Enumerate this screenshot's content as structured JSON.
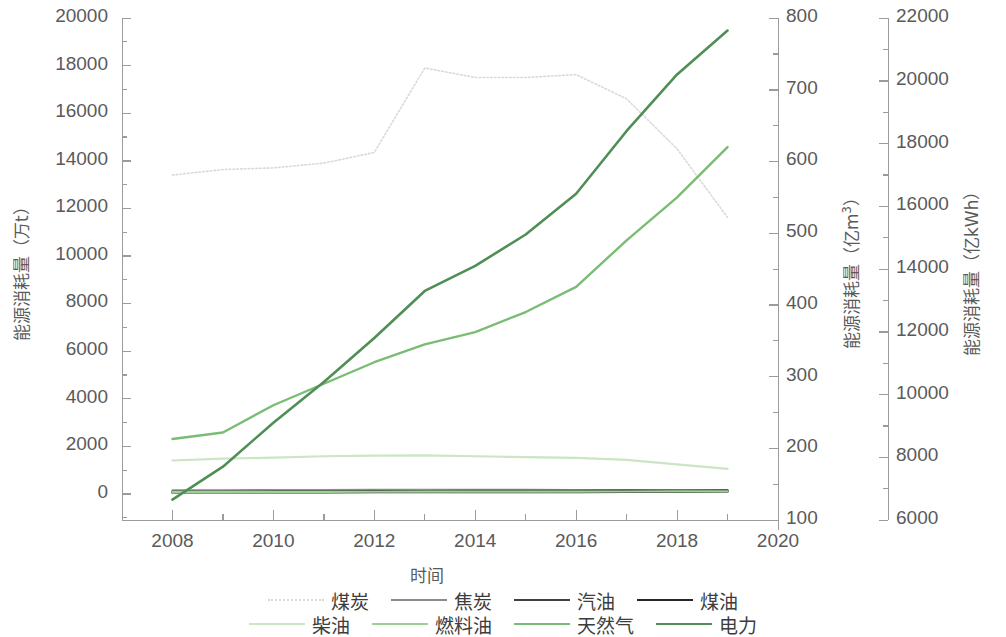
{
  "chart_data": {
    "type": "line",
    "title": "",
    "xlabel": "时间",
    "x": [
      2008,
      2009,
      2010,
      2011,
      2012,
      2013,
      2014,
      2015,
      2016,
      2017,
      2018,
      2019
    ],
    "xlim": [
      2007,
      2020
    ],
    "xticks": [
      2008,
      2010,
      2012,
      2014,
      2016,
      2018,
      2020
    ],
    "xminorticks": [
      2009,
      2011,
      2013,
      2015,
      2017,
      2019
    ],
    "grid": false,
    "legend_position": "bottom",
    "axes": [
      {
        "id": "left",
        "label": "能源消耗量（万t）",
        "unit": "万t",
        "lim": [
          -1100,
          20000
        ],
        "ticks": [
          0,
          2000,
          4000,
          6000,
          8000,
          10000,
          12000,
          14000,
          16000,
          18000,
          20000
        ],
        "minor_step": 1000
      },
      {
        "id": "right1",
        "label": "能源消耗量（亿m³）",
        "unit": "亿m3",
        "lim": [
          100,
          800
        ],
        "ticks": [
          100,
          200,
          300,
          400,
          500,
          600,
          700,
          800
        ],
        "minor_step": 50
      },
      {
        "id": "right2",
        "label": "能源消耗量（亿kWh）",
        "unit": "亿kWh",
        "lim": [
          6000,
          22000
        ],
        "ticks": [
          6000,
          8000,
          10000,
          12000,
          14000,
          16000,
          18000,
          20000,
          22000
        ],
        "minor_step": 1000
      }
    ],
    "series": [
      {
        "name": "煤炭",
        "axis": "left",
        "color": "#d9d9d9",
        "style": "dotted",
        "width": 1.6,
        "values": [
          13400,
          13630,
          13700,
          13900,
          14350,
          17900,
          17500,
          17500,
          17620,
          16600,
          14500,
          11620
        ]
      },
      {
        "name": "焦炭",
        "axis": "left",
        "color": "#8c8c8c",
        "style": "solid",
        "width": 2.0,
        "values": [
          150,
          150,
          160,
          165,
          170,
          175,
          175,
          170,
          165,
          160,
          155,
          150
        ]
      },
      {
        "name": "汽油",
        "axis": "left",
        "color": "#404040",
        "style": "solid",
        "width": 2.2,
        "values": [
          90,
          95,
          100,
          105,
          110,
          115,
          120,
          125,
          130,
          135,
          140,
          145
        ]
      },
      {
        "name": "煤油",
        "axis": "left",
        "color": "#262626",
        "style": "solid",
        "width": 2.4,
        "values": [
          60,
          62,
          65,
          68,
          70,
          73,
          75,
          78,
          80,
          85,
          90,
          95
        ]
      },
      {
        "name": "柴油",
        "axis": "left",
        "color": "#cbe5c5",
        "style": "solid",
        "width": 2.2,
        "values": [
          1400,
          1480,
          1520,
          1580,
          1610,
          1620,
          1580,
          1540,
          1510,
          1430,
          1240,
          1050
        ]
      },
      {
        "name": "燃料油",
        "axis": "left",
        "color": "#9ecf96",
        "style": "solid",
        "width": 2.2,
        "values": [
          80,
          82,
          84,
          86,
          88,
          90,
          92,
          94,
          96,
          98,
          100,
          102
        ]
      },
      {
        "name": "天然气",
        "axis": "right1",
        "color": "#79bd74",
        "style": "solid",
        "width": 2.4,
        "values": [
          213,
          222,
          260,
          290,
          320,
          345,
          362,
          390,
          425,
          490,
          550,
          620
        ]
      },
      {
        "name": "电力",
        "axis": "right2",
        "color": "#4f8f55",
        "style": "solid",
        "width": 2.6,
        "values": [
          6650,
          7700,
          9100,
          10400,
          11800,
          13300,
          14100,
          15100,
          16400,
          18400,
          20200,
          21600
        ]
      }
    ]
  },
  "legend": {
    "rows": [
      [
        {
          "label": "煤炭",
          "color": "#d9d9d9",
          "style": "dotted"
        },
        {
          "label": "焦炭",
          "color": "#8c8c8c",
          "style": "solid"
        },
        {
          "label": "汽油",
          "color": "#404040",
          "style": "solid"
        },
        {
          "label": "煤油",
          "color": "#262626",
          "style": "solid"
        }
      ],
      [
        {
          "label": "柴油",
          "color": "#cbe5c5",
          "style": "solid"
        },
        {
          "label": "燃料油",
          "color": "#9ecf96",
          "style": "solid"
        },
        {
          "label": "天然气",
          "color": "#79bd74",
          "style": "solid"
        },
        {
          "label": "电力",
          "color": "#4f8f55",
          "style": "solid"
        }
      ]
    ]
  }
}
